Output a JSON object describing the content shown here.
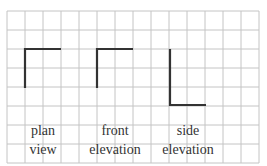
{
  "grid": {
    "left": 7,
    "top": 11,
    "cols": 14,
    "rows": 8,
    "cell_w": 18,
    "cell_h": 19,
    "line_color": "#c4c4c4"
  },
  "stroke_color": "#333333",
  "views": [
    {
      "name": "plan view",
      "line1": "plan",
      "line2": "view",
      "label_x": 43
    },
    {
      "name": "front elevation",
      "line1": "front",
      "line2": "elevation",
      "label_x": 115
    },
    {
      "name": "side elevation",
      "line1": "side",
      "line2": "elevation",
      "label_x": 188
    }
  ]
}
